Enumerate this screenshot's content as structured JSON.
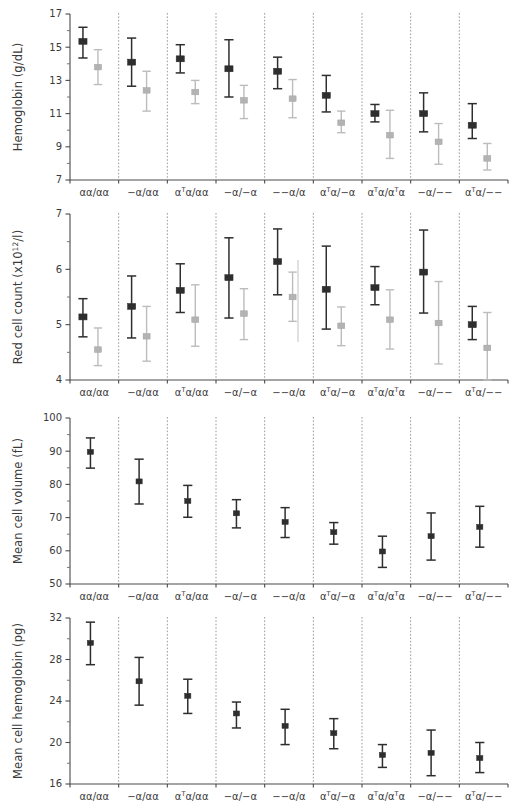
{
  "figure": {
    "title": "",
    "categories": [
      "αα/αα",
      "−α/αα",
      "αᵀα/αα",
      "−α/−α",
      "−−α/α",
      "αᵀα/−α",
      "αᵀα/αᵀα",
      "−α/−−",
      "αᵀα/−−"
    ],
    "series_colors": {
      "dark": "#2e2e2e",
      "light": "#b3b3b3"
    }
  },
  "chart_data": [
    {
      "type": "scatter",
      "id": "hemoglobin",
      "title": "",
      "ylabel": "Hemoglobin (g/dL)",
      "xlabel": "",
      "ylim": [
        7,
        17
      ],
      "yticks": [
        7,
        9,
        11,
        13,
        15,
        17
      ],
      "yticks_minor": [
        8,
        10,
        12,
        14,
        16
      ],
      "grid": false,
      "legend": "none",
      "categories": [
        "αα/αα",
        "−α/αα",
        "αᵀα/αα",
        "−α/−α",
        "−−α/α",
        "αᵀα/−α",
        "αᵀα/αᵀα",
        "−α/−−",
        "αᵀα/−−"
      ],
      "series": [
        {
          "name": "dark",
          "color": "#2e2e2e",
          "values": [
            15.35,
            14.1,
            14.3,
            13.7,
            13.55,
            12.1,
            11.0,
            11.0,
            10.3
          ],
          "lower": [
            14.35,
            12.65,
            13.45,
            12.0,
            12.5,
            11.1,
            10.5,
            9.9,
            9.5
          ],
          "upper": [
            16.2,
            15.55,
            15.15,
            15.45,
            14.4,
            13.3,
            11.55,
            12.25,
            11.6
          ]
        },
        {
          "name": "light",
          "color": "#b3b3b3",
          "values": [
            13.8,
            12.4,
            12.3,
            11.8,
            11.9,
            10.45,
            9.7,
            9.3,
            8.3
          ],
          "lower": [
            12.75,
            11.15,
            11.6,
            10.7,
            10.75,
            9.85,
            8.3,
            7.95,
            7.6
          ],
          "upper": [
            14.85,
            13.55,
            13.0,
            12.7,
            13.05,
            11.15,
            11.2,
            10.4,
            9.2
          ]
        }
      ]
    },
    {
      "type": "scatter",
      "id": "red-cell-count",
      "title": "",
      "ylabel": "Red cell count (x10¹²/l)",
      "xlabel": "",
      "ylim": [
        4,
        7
      ],
      "yticks": [
        4,
        5,
        6,
        7
      ],
      "yticks_minor": [
        4.5,
        5.5,
        6.5
      ],
      "grid": false,
      "legend": "none",
      "categories": [
        "αα/αα",
        "−α/αα",
        "αᵀα/αα",
        "−α/−α",
        "−−α/α",
        "αᵀα/−α",
        "αᵀα/αᵀα",
        "−α/−−",
        "αᵀα/−−"
      ],
      "series": [
        {
          "name": "dark",
          "color": "#2e2e2e",
          "values": [
            5.14,
            5.33,
            5.62,
            5.85,
            6.14,
            5.64,
            5.67,
            5.95,
            5.0
          ],
          "lower": [
            4.78,
            4.76,
            5.22,
            5.12,
            5.54,
            4.92,
            5.36,
            5.21,
            4.73
          ],
          "upper": [
            5.47,
            5.88,
            6.1,
            6.57,
            6.73,
            6.42,
            6.05,
            6.71,
            5.33
          ]
        },
        {
          "name": "light",
          "color": "#b3b3b3",
          "values": [
            4.55,
            4.79,
            5.09,
            5.2,
            5.5,
            4.98,
            5.09,
            5.03,
            4.58
          ],
          "lower": [
            4.26,
            4.34,
            4.61,
            4.73,
            5.06,
            4.62,
            4.56,
            4.29,
            4.0
          ],
          "upper": [
            4.94,
            5.33,
            5.72,
            5.65,
            5.95,
            5.32,
            5.63,
            5.78,
            5.22
          ]
        }
      ]
    },
    {
      "type": "scatter",
      "id": "mean-cell-volume",
      "title": "",
      "ylabel": "Mean cell volume (fL)",
      "xlabel": "",
      "ylim": [
        50,
        100
      ],
      "yticks": [
        50,
        60,
        70,
        80,
        90,
        100
      ],
      "yticks_minor": [
        55,
        65,
        75,
        85,
        95
      ],
      "grid": false,
      "legend": "none",
      "categories": [
        "αα/αα",
        "−α/αα",
        "αᵀα/αα",
        "−α/−α",
        "−−α/α",
        "αᵀα/−α",
        "αᵀα/αᵀα",
        "−α/−−",
        "αᵀα/−−"
      ],
      "series": [
        {
          "name": "dark",
          "color": "#2e2e2e",
          "values": [
            89.8,
            80.9,
            75.0,
            71.3,
            68.7,
            65.6,
            59.8,
            64.4,
            67.2
          ],
          "lower": [
            84.9,
            74.1,
            70.1,
            66.9,
            64.0,
            62.0,
            55.0,
            57.2,
            61.1
          ],
          "upper": [
            94.0,
            87.6,
            79.7,
            75.4,
            73.0,
            68.5,
            64.4,
            71.4,
            73.4
          ]
        }
      ]
    },
    {
      "type": "scatter",
      "id": "mean-cell-hemoglobin",
      "title": "",
      "ylabel": "Mean cell hemoglobin (pg)",
      "xlabel": "",
      "ylim": [
        16,
        32
      ],
      "yticks": [
        16,
        20,
        24,
        28,
        32
      ],
      "yticks_minor": [
        18,
        22,
        26,
        30
      ],
      "grid": false,
      "legend": "none",
      "categories": [
        "αα/αα",
        "−α/αα",
        "αᵀα/αα",
        "−α/−α",
        "−−α/α",
        "αᵀα/−α",
        "αᵀα/αᵀα",
        "−α/−−",
        "αᵀα/−−"
      ],
      "series": [
        {
          "name": "dark",
          "color": "#2e2e2e",
          "values": [
            29.6,
            25.9,
            24.5,
            22.8,
            21.6,
            20.9,
            18.8,
            19.0,
            18.5
          ],
          "lower": [
            27.5,
            23.6,
            22.8,
            21.4,
            19.8,
            19.4,
            17.6,
            16.8,
            17.1
          ],
          "upper": [
            31.6,
            28.2,
            26.1,
            23.9,
            23.2,
            22.3,
            19.8,
            21.2,
            20.0
          ]
        }
      ]
    }
  ]
}
